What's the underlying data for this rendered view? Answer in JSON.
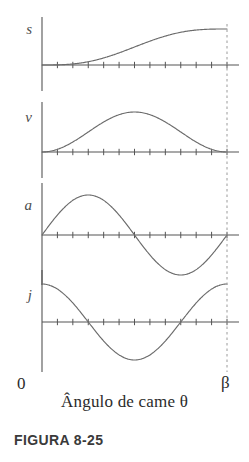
{
  "figure": {
    "caption": "FIGURA 8-25",
    "x_axis_caption": "Ângulo de came θ",
    "origin_label": "0",
    "end_label": "β"
  },
  "colors": {
    "curve": "#6b6b6b",
    "axis": "#555555",
    "dashed": "#9a9a9a",
    "text": "#2b2b2b",
    "var_label": "#4d4d4d",
    "background": "#ffffff"
  },
  "plots": [
    {
      "id": "s",
      "label": "s",
      "name": "displacement",
      "baseline_y": 65
    },
    {
      "id": "v",
      "label": "v",
      "name": "velocity",
      "baseline_y": 152
    },
    {
      "id": "a",
      "label": "a",
      "name": "acceleration",
      "baseline_y": 235
    },
    {
      "id": "j",
      "label": "j",
      "name": "jerk",
      "baseline_y": 322
    }
  ],
  "chart_data": {
    "type": "line",
    "title": "FIGURA 8-25",
    "xlabel": "Ângulo de came θ",
    "ylabel": "",
    "x_tick_labels": [
      "0",
      "β"
    ],
    "xlim": [
      0,
      1
    ],
    "grid": false,
    "legend": "none",
    "n_ticks": 12,
    "panels": [
      {
        "name": "s",
        "ylabel": "s",
        "description": "cycloidal displacement, rises monotonically from 0 to 1",
        "x": [
          0,
          0.1,
          0.2,
          0.3,
          0.4,
          0.5,
          0.6,
          0.7,
          0.8,
          0.9,
          1.0
        ],
        "y": [
          0.0,
          0.017,
          0.095,
          0.23,
          0.375,
          0.5,
          0.625,
          0.77,
          0.905,
          0.983,
          1.0
        ],
        "ylim": [
          0,
          1.05
        ]
      },
      {
        "name": "v",
        "ylabel": "v",
        "description": "velocity, half-sine squared bell, zero at both ends",
        "x": [
          0,
          0.1,
          0.2,
          0.3,
          0.4,
          0.5,
          0.6,
          0.7,
          0.8,
          0.9,
          1.0
        ],
        "y": [
          0.0,
          0.095,
          0.345,
          0.655,
          0.905,
          1.0,
          0.905,
          0.655,
          0.345,
          0.095,
          0.0
        ],
        "ylim": [
          0,
          1.05
        ]
      },
      {
        "name": "a",
        "ylabel": "a",
        "description": "acceleration, full sine wave positive then negative",
        "x": [
          0,
          0.1,
          0.2,
          0.25,
          0.3,
          0.4,
          0.5,
          0.6,
          0.7,
          0.75,
          0.8,
          0.9,
          1.0
        ],
        "y": [
          0.0,
          0.588,
          0.951,
          1.0,
          0.951,
          0.588,
          0.0,
          -0.588,
          -0.951,
          -1.0,
          -0.951,
          -0.588,
          0.0
        ],
        "ylim": [
          -1.05,
          1.05
        ]
      },
      {
        "name": "j",
        "ylabel": "j",
        "description": "jerk, cosine curve, max at ends, minimum at midpoint",
        "x": [
          0,
          0.1,
          0.2,
          0.3,
          0.4,
          0.5,
          0.6,
          0.7,
          0.8,
          0.9,
          1.0
        ],
        "y": [
          1.0,
          0.809,
          0.309,
          -0.309,
          -0.809,
          -1.0,
          -0.809,
          -0.309,
          0.309,
          0.809,
          1.0
        ],
        "ylim": [
          -1.05,
          1.05
        ]
      }
    ]
  }
}
